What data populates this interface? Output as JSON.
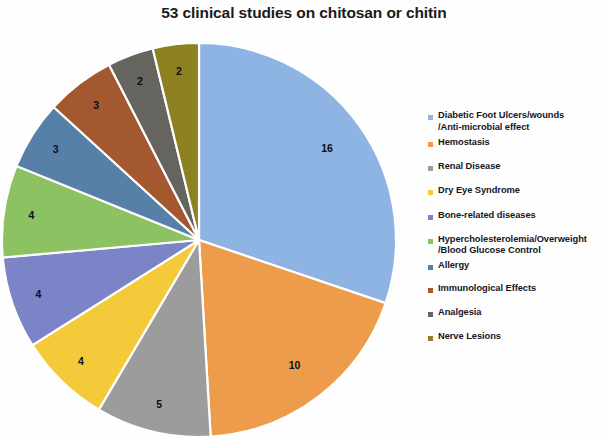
{
  "chart_data": {
    "type": "pie",
    "title": "53 clinical studies on chitosan or chitin",
    "total": 53,
    "categories": [
      "Diabetic Foot Ulcers/wounds\n/Anti-microbial effect",
      "Hemostasis",
      " Renal Disease",
      "Dry Eye Syndrome",
      "Bone-related diseases",
      "Hypercholesterolemia/Overweight\n/Blood Glucose Control",
      "Allergy",
      "Immunological Effects",
      "Analgesia",
      "Nerve Lesions"
    ],
    "values": [
      16,
      10,
      5,
      4,
      4,
      4,
      3,
      3,
      2,
      2
    ],
    "value_labels": [
      "16",
      "10",
      "5",
      "4",
      "4",
      "4",
      "3",
      "3",
      "2",
      "2"
    ],
    "colors": [
      "#8DB4E2",
      "#ED9C4C",
      "#9C9C9C",
      "#F5CA3A",
      "#7B84C6",
      "#8DC262",
      "#5780A8",
      "#A3582F",
      "#66645E",
      "#8C8020"
    ],
    "start_angle_deg": 0,
    "direction": "clockwise",
    "grid": false,
    "legend_position": "right",
    "xlabel": "",
    "ylabel": ""
  },
  "legend": {
    "items": [
      {
        "label": "Diabetic Foot Ulcers/wounds\n/Anti-microbial effect",
        "color": "#8DB4E2"
      },
      {
        "label": "Hemostasis",
        "color": "#ED9C4C"
      },
      {
        "label": " Renal Disease",
        "color": "#9C9C9C"
      },
      {
        "label": "Dry Eye Syndrome",
        "color": "#F5CA3A"
      },
      {
        "label": "Bone-related diseases",
        "color": "#7B84C6"
      },
      {
        "label": "Hypercholesterolemia/Overweight\n/Blood Glucose Control",
        "color": "#8DC262"
      },
      {
        "label": "Allergy",
        "color": "#5780A8"
      },
      {
        "label": "Immunological Effects",
        "color": "#A3582F"
      },
      {
        "label": "Analgesia",
        "color": "#66645E"
      },
      {
        "label": "Nerve Lesions",
        "color": "#8C8020"
      }
    ]
  }
}
